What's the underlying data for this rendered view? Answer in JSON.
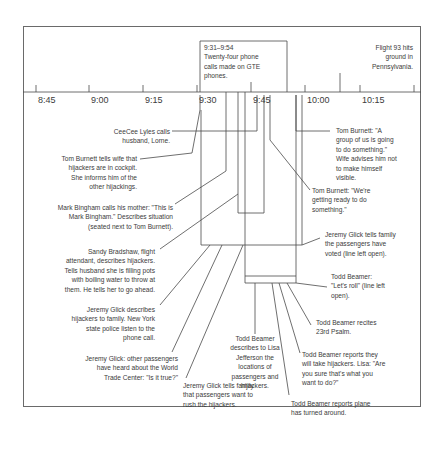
{
  "axis": {
    "ticks": [
      "8:45",
      "9:00",
      "9:15",
      "9:30",
      "9:45",
      "10:00",
      "10:15"
    ]
  },
  "top_box": {
    "text": "9:31–9:54\nTwenty-four phone\ncalls made on GTE\nphones."
  },
  "top_event": {
    "text": "Flight 93 hits\nground in\nPennsylvania."
  },
  "events": [
    {
      "id": "ceecee",
      "text": "CeeCee Lyles calls\nhusband, Lorne."
    },
    {
      "id": "burnett1",
      "text": "Tom Burnett tells wife that\nhijackers are in cockpit.\nShe informs him of the\nother hijackings."
    },
    {
      "id": "bingham",
      "text": "Mark Bingham calls his mother: \"This is\nMark Bingham.\" Describes situation\n(seated next to Tom Burnett)."
    },
    {
      "id": "bradshaw",
      "text": "Sandy Bradshaw, flight\nattendant, describes hijackers.\nTells husband she is filling pots\nwith boiling water to throw at\nthem. He tells her to go ahead."
    },
    {
      "id": "glick1",
      "text": "Jeremy Glick describes\nhijackers to family. New York\nstate police listen to the\nphone call."
    },
    {
      "id": "glick2",
      "text": "Jeremy Glick: other passengers\nhave heard about the World\nTrade Center: \"Is it true?\""
    },
    {
      "id": "glick3",
      "text": "Jeremy Glick tells family\nthat passengers want to\nrush the hijackers."
    },
    {
      "id": "beamer1",
      "text": "Todd Beamer\ndescribes to Lisa\nJefferson the\nlocations of\npassengers and\nhijackers."
    },
    {
      "id": "beamer_turn",
      "text": "Todd Beamer reports plane\nhas turned around."
    },
    {
      "id": "beamer_take",
      "text": "Todd Beamer reports they\nwill take hijackers.  Lisa: \"Are\nyou sure that's what you\nwant to do?\""
    },
    {
      "id": "beamer_psalm",
      "text": "Todd Beamer recites\n23rd Psalm."
    },
    {
      "id": "beamer_roll",
      "text": "Todd Beamer:\n\"Let's roll\" (line left\nopen)."
    },
    {
      "id": "glick_vote",
      "text": "Jeremy Glick tells family\nthe passengers have\nvoted (line left open)."
    },
    {
      "id": "burnett_ready",
      "text": "Tom Burnett: \"We're\ngetting ready to do\nsomething.\""
    },
    {
      "id": "burnett_group",
      "text": "Tom Burnett: \"A\ngroup of us is going\nto do something.\"\nWife  advises him not\nto make himself\nvisible."
    }
  ]
}
